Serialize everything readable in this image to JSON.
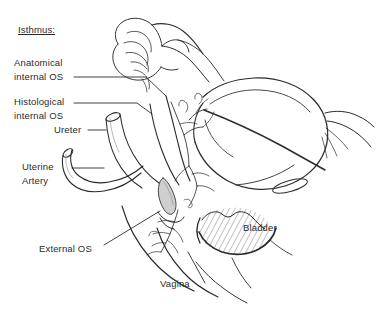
{
  "figure": {
    "title_caption": "",
    "kind": "anatomical-line-drawing",
    "background_color": "#ffffff",
    "ink_color": "#2b2b2b",
    "hatch_color": "#555555"
  },
  "labels": {
    "isthmus": "Isthmus:",
    "anatomical_internal_os_line1": "Anatomical",
    "anatomical_internal_os_line2": "internal OS",
    "histological_internal_os_line1": "Histological",
    "histological_internal_os_line2": "internal OS",
    "ureter": "Ureter",
    "uterine_artery_line1": "Uterine",
    "uterine_artery_line2": "Artery",
    "external_os": "External OS",
    "vagina": "Vagina",
    "bladder": "Bladder"
  },
  "annotations": [
    {
      "name": "isthmus",
      "text": "Isthmus:",
      "underlined": true,
      "leader": false
    },
    {
      "name": "anatomical-internal-os",
      "text": "Anatomical internal OS",
      "underlined": false,
      "leader": true
    },
    {
      "name": "histological-internal-os",
      "text": "Histological internal OS",
      "underlined": false,
      "leader": true
    },
    {
      "name": "ureter",
      "text": "Ureter",
      "underlined": false,
      "leader": true
    },
    {
      "name": "uterine-artery",
      "text": "Uterine Artery",
      "underlined": false,
      "leader": true
    },
    {
      "name": "external-os",
      "text": "External OS",
      "underlined": false,
      "leader": true
    },
    {
      "name": "vagina",
      "text": "Vagina",
      "underlined": false,
      "leader": true
    },
    {
      "name": "bladder",
      "text": "Bladder",
      "underlined": false,
      "leader": false
    }
  ]
}
